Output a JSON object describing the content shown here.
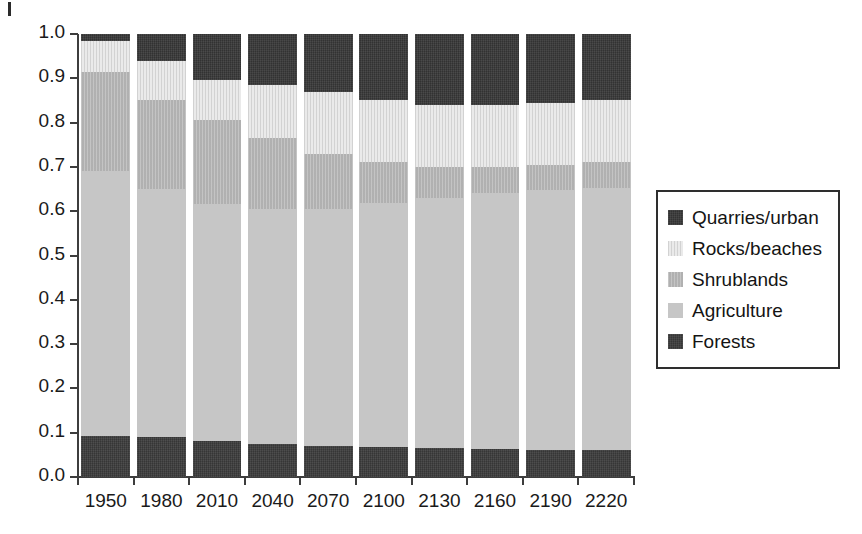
{
  "chart_data": {
    "type": "bar",
    "subtype": "stacked-100-percent",
    "title": "",
    "xlabel": "",
    "ylabel": "",
    "categories": [
      "1950",
      "1980",
      "2010",
      "2040",
      "2070",
      "2100",
      "2130",
      "2160",
      "2190",
      "2220"
    ],
    "ylim": [
      0.0,
      1.0
    ],
    "ytick_labels": [
      "0.0",
      "0.1",
      "0.2",
      "0.3",
      "0.4",
      "0.5",
      "0.6",
      "0.7",
      "0.8",
      "0.9",
      "1.0"
    ],
    "ytick_values": [
      0.0,
      0.1,
      0.2,
      0.3,
      0.4,
      0.5,
      0.6,
      0.7,
      0.8,
      0.9,
      1.0
    ],
    "grid": false,
    "legend_position": "right",
    "stack_order_bottom_to_top": [
      "Forests",
      "Agriculture",
      "Shrublands",
      "Rocks/beaches",
      "Quarries/urban"
    ],
    "series": [
      {
        "name": "Forests",
        "color": "#3c3c3c",
        "values": [
          0.093,
          0.09,
          0.082,
          0.075,
          0.071,
          0.068,
          0.066,
          0.064,
          0.062,
          0.06
        ]
      },
      {
        "name": "Agriculture",
        "color": "#c6c6c6",
        "values": [
          0.597,
          0.56,
          0.535,
          0.53,
          0.534,
          0.551,
          0.564,
          0.576,
          0.586,
          0.593
        ]
      },
      {
        "name": "Shrublands",
        "color": "#b4b4b4",
        "values": [
          0.225,
          0.2,
          0.188,
          0.16,
          0.125,
          0.091,
          0.07,
          0.06,
          0.057,
          0.057
        ]
      },
      {
        "name": "Rocks/beaches",
        "color": "#dedede",
        "values": [
          0.07,
          0.09,
          0.092,
          0.12,
          0.14,
          0.14,
          0.14,
          0.14,
          0.14,
          0.14
        ]
      },
      {
        "name": "Quarries/urban",
        "color": "#383838",
        "values": [
          0.015,
          0.06,
          0.103,
          0.115,
          0.13,
          0.15,
          0.16,
          0.16,
          0.155,
          0.15
        ]
      }
    ]
  },
  "legend": {
    "items": [
      {
        "label": "Quarries/urban",
        "swatch": "fill-quarries"
      },
      {
        "label": "Rocks/beaches",
        "swatch": "fill-rocks"
      },
      {
        "label": "Shrublands",
        "swatch": "fill-shrublands"
      },
      {
        "label": "Agriculture",
        "swatch": "fill-agriculture"
      },
      {
        "label": "Forests",
        "swatch": "fill-forests"
      }
    ]
  }
}
